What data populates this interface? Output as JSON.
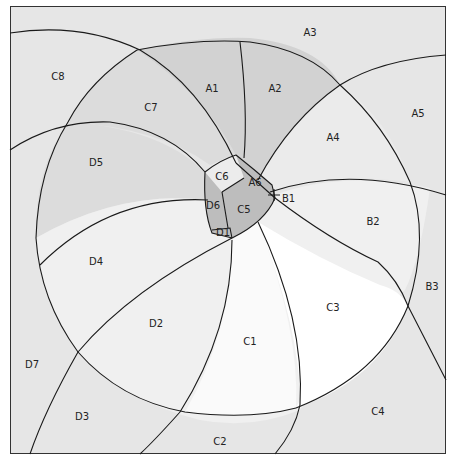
{
  "diagram": {
    "type": "venn-like region partition",
    "colors": {
      "background": "#e6e6e6",
      "A_region": "#d2d2d2",
      "C7_D5": "#dcdcdc",
      "inner_light": "#f0f0f0",
      "bright": "#ffffff",
      "core": "#bdbdbd",
      "stroke": "#1a1a1a"
    },
    "regions": [
      {
        "id": "A1",
        "label": "A1",
        "x": 212,
        "y": 89
      },
      {
        "id": "A2",
        "label": "A2",
        "x": 275,
        "y": 89
      },
      {
        "id": "A3",
        "label": "A3",
        "x": 310,
        "y": 33
      },
      {
        "id": "A4",
        "label": "A4",
        "x": 333,
        "y": 138
      },
      {
        "id": "A5",
        "label": "A5",
        "x": 418,
        "y": 114
      },
      {
        "id": "A6",
        "label": "A6",
        "x": 255,
        "y": 183
      },
      {
        "id": "B1",
        "label": "B1",
        "x": 282,
        "y": 199
      },
      {
        "id": "B2",
        "label": "B2",
        "x": 373,
        "y": 222
      },
      {
        "id": "B3",
        "label": "B3",
        "x": 432,
        "y": 287
      },
      {
        "id": "C1",
        "label": "C1",
        "x": 250,
        "y": 342
      },
      {
        "id": "C2",
        "label": "C2",
        "x": 220,
        "y": 442
      },
      {
        "id": "C3",
        "label": "C3",
        "x": 333,
        "y": 308
      },
      {
        "id": "C4",
        "label": "C4",
        "x": 378,
        "y": 412
      },
      {
        "id": "C5",
        "label": "C5",
        "x": 244,
        "y": 210
      },
      {
        "id": "C6",
        "label": "C6",
        "x": 222,
        "y": 177
      },
      {
        "id": "C7",
        "label": "C7",
        "x": 151,
        "y": 108
      },
      {
        "id": "C8",
        "label": "C8",
        "x": 58,
        "y": 77
      },
      {
        "id": "D1",
        "label": "D1",
        "x": 223,
        "y": 233
      },
      {
        "id": "D2",
        "label": "D2",
        "x": 156,
        "y": 324
      },
      {
        "id": "D3",
        "label": "D3",
        "x": 82,
        "y": 417
      },
      {
        "id": "D4",
        "label": "D4",
        "x": 96,
        "y": 262
      },
      {
        "id": "D5",
        "label": "D5",
        "x": 96,
        "y": 163
      },
      {
        "id": "D6",
        "label": "D6",
        "x": 213,
        "y": 206
      },
      {
        "id": "D7",
        "label": "D7",
        "x": 32,
        "y": 365
      }
    ]
  }
}
